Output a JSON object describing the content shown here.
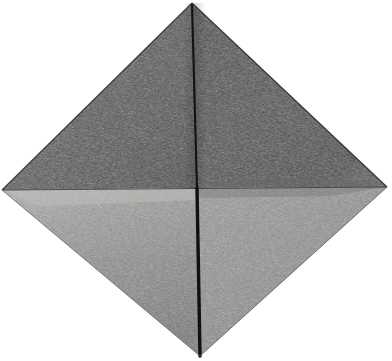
{
  "image": {
    "subject": "folded paper diamond",
    "description": "Grayscale photograph of a square sheet of paper folded into a diamond-oriented origami base, showing four triangular facets and a vertical centre crease",
    "background_color": "#ffffff",
    "width": 392,
    "height": 361,
    "alt_text": "A dark grey folded paper square rotated 45 degrees, top half in shadow, bottom half lit, with a sharp vertical crease down the middle"
  },
  "geometry": {
    "vertices": {
      "top": {
        "label": "top apex",
        "x": 192,
        "y": 3
      },
      "right": {
        "label": "right corner",
        "x": 387,
        "y": 187
      },
      "bottom": {
        "label": "bottom apex",
        "x": 200,
        "y": 356
      },
      "left": {
        "label": "left corner",
        "x": 2,
        "y": 190
      },
      "center": {
        "label": "centre fold intersection",
        "x": 197,
        "y": 188
      }
    }
  },
  "facets": [
    {
      "id": "upper-left",
      "name": "upper left facet",
      "tone_label": "dark grey",
      "fill_start": "#555455",
      "fill_end": "#3f3e3f",
      "points": "192,3 197,188 2,190"
    },
    {
      "id": "upper-right",
      "name": "upper right facet",
      "tone_label": "darkest grey",
      "fill_start": "#474647",
      "fill_end": "#38373a",
      "points": "192,3 387,187 197,188"
    },
    {
      "id": "lower-left",
      "name": "lower left facet",
      "tone_label": "light grey highlight",
      "fill_start": "#a3a3a1",
      "fill_end": "#6e6e6d",
      "points": "2,190 197,188 200,356"
    },
    {
      "id": "lower-right",
      "name": "lower right facet",
      "tone_label": "mid grey",
      "fill_start": "#8e8e8c",
      "fill_end": "#7b7b79",
      "points": "197,188 387,187 200,356"
    }
  ],
  "creases": [
    {
      "id": "vertical-crease-upper",
      "name": "upper vertical crease",
      "color": "#121212",
      "x1": 192,
      "y1": 5,
      "x2": 197,
      "y2": 188,
      "width": 2.1
    },
    {
      "id": "vertical-crease-lower",
      "name": "lower vertical crease",
      "color": "#101010",
      "x1": 197,
      "y1": 188,
      "x2": 200,
      "y2": 356,
      "width": 3.4
    },
    {
      "id": "horizontal-crease",
      "name": "horizontal fold edge",
      "color": "#2e2e2e",
      "x1": 2,
      "y1": 190,
      "x2": 387,
      "y2": 187,
      "width": 1.1
    },
    {
      "id": "left-edge-highlight",
      "name": "lower left edge highlight",
      "color": "#c9c9c6",
      "x1": 4,
      "y1": 191,
      "x2": 196,
      "y2": 189,
      "width": 2.6
    }
  ],
  "edges": [
    {
      "id": "edge-top-left",
      "name": "top left paper edge",
      "x1": 192,
      "y1": 3,
      "x2": 2,
      "y2": 190,
      "color": "#2b2b2c"
    },
    {
      "id": "edge-top-right",
      "name": "top right paper edge",
      "x1": 192,
      "y1": 3,
      "x2": 387,
      "y2": 187,
      "color": "#242425"
    },
    {
      "id": "edge-bottom-left",
      "name": "bottom left paper edge",
      "x1": 2,
      "y1": 190,
      "x2": 200,
      "y2": 356,
      "color": "#6b6b69"
    },
    {
      "id": "edge-bottom-right",
      "name": "bottom right paper edge",
      "x1": 387,
      "y1": 187,
      "x2": 200,
      "y2": 356,
      "color": "#5f5f5e"
    }
  ]
}
